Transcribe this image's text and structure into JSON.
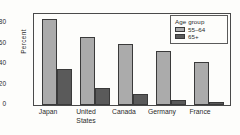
{
  "chart_data": {
    "type": "bar",
    "title": "",
    "xlabel": "",
    "ylabel": "Percent",
    "ylim": [
      0,
      90
    ],
    "yticks": [
      0,
      20,
      40,
      60,
      80
    ],
    "grid": false,
    "legend_position": "top-right",
    "legend_title": "Age group",
    "categories": [
      "Japan",
      "United States",
      "Canada",
      "Germany",
      "France"
    ],
    "category_lines": [
      [
        "Japan"
      ],
      [
        "United",
        "States"
      ],
      [
        "Canada"
      ],
      [
        "Germany"
      ],
      [
        "France"
      ]
    ],
    "series": [
      {
        "name": "55–64",
        "color": "#ababab",
        "values": [
          85,
          67,
          60,
          53,
          43
        ]
      },
      {
        "name": "65+",
        "color": "#5a5a5a",
        "values": [
          36,
          17,
          11,
          5,
          3
        ]
      }
    ]
  },
  "axis": {
    "y_title": "Percent",
    "tick_labels": [
      "80",
      "60",
      "40",
      "20",
      "0"
    ]
  },
  "legend": {
    "title": "Age group",
    "entries": [
      {
        "label": "55–64",
        "swatch": "light"
      },
      {
        "label": "65+",
        "swatch": "dark"
      }
    ]
  },
  "xlabels": [
    {
      "line1": "Japan",
      "line2": ""
    },
    {
      "line1": "United",
      "line2": "States"
    },
    {
      "line1": "Canada",
      "line2": ""
    },
    {
      "line1": "Germany",
      "line2": ""
    },
    {
      "line1": "France",
      "line2": ""
    }
  ]
}
